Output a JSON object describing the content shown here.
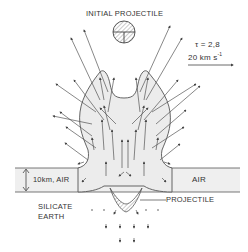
{
  "labels": {
    "initial_projectile": "INITIAL PROJECTILE",
    "tau": "τ = 2,8",
    "velocity_scale": "20 km  s",
    "velocity_exp": "-1",
    "air_layer": "10km, AIR",
    "air_right": "AIR",
    "projectile": "PROJECTILE",
    "silicate_line1": "SILICATE",
    "silicate_line2": "EARTH"
  },
  "colors": {
    "line": "#555555",
    "shade": "#ececec",
    "text": "#333333"
  }
}
